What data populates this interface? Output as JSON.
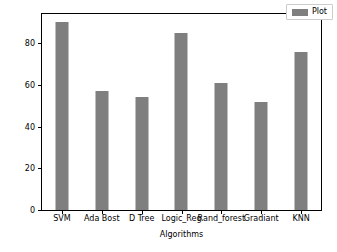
{
  "chart_data": {
    "type": "bar",
    "title": "",
    "xlabel": "Algorithms",
    "ylabel": "Percentage accuracy",
    "categories": [
      "SVM",
      "Ada Bost",
      "D Tree",
      "Logic_Reg",
      "Rand_forest",
      "Gradiant",
      "KNN"
    ],
    "values": [
      90,
      57,
      54,
      85,
      61,
      52,
      76
    ],
    "series": [
      {
        "name": "Plot",
        "values": [
          90,
          57,
          54,
          85,
          61,
          52,
          76
        ],
        "color": "#7f7f7f"
      }
    ],
    "ylim": [
      0,
      94
    ],
    "yticks": [
      0,
      20,
      40,
      60,
      80
    ],
    "ytick_labels": [
      "0",
      "20",
      "40",
      "60",
      "80"
    ],
    "grid": false,
    "legend": {
      "entries": [
        {
          "label": "Plot",
          "color": "#7f7f7f"
        }
      ],
      "position": "upper right"
    },
    "bar_color": "#7f7f7f",
    "axis_color": "#000000",
    "background_color": "#ffffff"
  }
}
